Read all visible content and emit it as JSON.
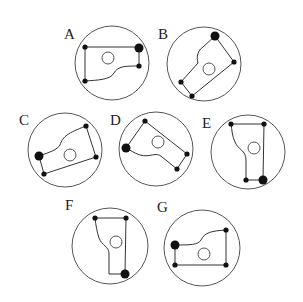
{
  "colors": {
    "background": "#ffffff",
    "stroke": "#333333",
    "dot": "#111111"
  },
  "panels": [
    {
      "label": "A",
      "label_pos": [
        64,
        39
      ],
      "circle": {
        "cx": 112,
        "cy": 63,
        "r": 37
      },
      "inner_circle": {
        "cx": 108,
        "cy": 58,
        "r": 6
      },
      "path": "M85 47 L139 47 L139 66 C125 66 118 66 114 73 C110 80 98 80 85 81 Z",
      "dots": [
        {
          "x": 85,
          "y": 47,
          "r": 2.6,
          "large": false
        },
        {
          "x": 139,
          "y": 48,
          "r": 4.5,
          "large": true
        },
        {
          "x": 139,
          "y": 66,
          "r": 2.6,
          "large": false
        },
        {
          "x": 85,
          "y": 81,
          "r": 2.6,
          "large": false
        }
      ]
    },
    {
      "label": "B",
      "label_pos": [
        158,
        39
      ],
      "circle": {
        "cx": 204,
        "cy": 64,
        "r": 37
      },
      "inner_circle": {
        "cx": 209,
        "cy": 69,
        "r": 6
      },
      "path": "M215 36 L234 62 L192 96 L181 82 L198 63 C196 57 198 50 203 47 Z",
      "dots": [
        {
          "x": 215,
          "y": 36,
          "r": 4.5,
          "large": true
        },
        {
          "x": 234,
          "y": 62,
          "r": 2.6,
          "large": false
        },
        {
          "x": 192,
          "y": 96,
          "r": 2.6,
          "large": false
        },
        {
          "x": 181,
          "y": 82,
          "r": 2.6,
          "large": false
        }
      ]
    },
    {
      "label": "C",
      "label_pos": [
        19,
        125
      ],
      "circle": {
        "cx": 65,
        "cy": 150,
        "r": 37
      },
      "inner_circle": {
        "cx": 70,
        "cy": 155,
        "r": 6
      },
      "path": "M39 156 C50 152 57 150 60 145 C63 136 68 133 86 126 L96 157 L44 174 Z",
      "dots": [
        {
          "x": 39,
          "y": 156,
          "r": 4.5,
          "large": true
        },
        {
          "x": 86,
          "y": 126,
          "r": 2.6,
          "large": false
        },
        {
          "x": 96,
          "y": 157,
          "r": 2.6,
          "large": false
        },
        {
          "x": 44,
          "y": 174,
          "r": 2.6,
          "large": false
        }
      ]
    },
    {
      "label": "D",
      "label_pos": [
        110,
        125
      ],
      "circle": {
        "cx": 156,
        "cy": 149,
        "r": 37
      },
      "inner_circle": {
        "cx": 158,
        "cy": 142,
        "r": 6
      },
      "path": "M126 148 L145 121 L187 154 L177 169 L162 157 C156 151 150 158 140 155 C134 153 130 150 126 148 Z",
      "dots": [
        {
          "x": 126,
          "y": 148,
          "r": 4.5,
          "large": true
        },
        {
          "x": 145,
          "y": 121,
          "r": 2.6,
          "large": false
        },
        {
          "x": 187,
          "y": 154,
          "r": 2.6,
          "large": false
        },
        {
          "x": 177,
          "y": 169,
          "r": 2.6,
          "large": false
        }
      ]
    },
    {
      "label": "E",
      "label_pos": [
        202,
        128
      ],
      "circle": {
        "cx": 248,
        "cy": 152,
        "r": 37
      },
      "inner_circle": {
        "cx": 254,
        "cy": 148,
        "r": 6
      },
      "path": "M231 124 L264 124 L263 180 L246 180 L246 160 C246 150 238 150 235 142 C232 136 232 130 231 124 Z",
      "dots": [
        {
          "x": 231,
          "y": 124,
          "r": 2.6,
          "large": false
        },
        {
          "x": 264,
          "y": 124,
          "r": 2.6,
          "large": false
        },
        {
          "x": 263,
          "y": 180,
          "r": 4.5,
          "large": true
        },
        {
          "x": 246,
          "y": 180,
          "r": 2.6,
          "large": false
        }
      ]
    },
    {
      "label": "F",
      "label_pos": [
        65,
        210
      ],
      "circle": {
        "cx": 110,
        "cy": 246,
        "r": 38
      },
      "inner_circle": {
        "cx": 116,
        "cy": 242,
        "r": 6
      },
      "path": "M95 218 L126 218 L125 274 L109 274 L109 254 C109 246 102 246 99 238 C97 232 96 226 95 218 Z",
      "dots": [
        {
          "x": 95,
          "y": 218,
          "r": 2.6,
          "large": false
        },
        {
          "x": 126,
          "y": 218,
          "r": 2.6,
          "large": false
        },
        {
          "x": 125,
          "y": 274,
          "r": 4.5,
          "large": true
        }
      ]
    },
    {
      "label": "G",
      "label_pos": [
        157,
        212
      ],
      "circle": {
        "cx": 202,
        "cy": 248,
        "r": 38
      },
      "inner_circle": {
        "cx": 204,
        "cy": 254,
        "r": 6
      },
      "path": "M175 245 C190 245 198 245 201 240 C205 232 212 231 226 230 L226 265 L175 265 Z",
      "dots": [
        {
          "x": 175,
          "y": 245,
          "r": 4.5,
          "large": true
        },
        {
          "x": 226,
          "y": 230,
          "r": 2.6,
          "large": false
        },
        {
          "x": 226,
          "y": 265,
          "r": 2.6,
          "large": false
        },
        {
          "x": 175,
          "y": 265,
          "r": 2.6,
          "large": false
        }
      ]
    }
  ]
}
